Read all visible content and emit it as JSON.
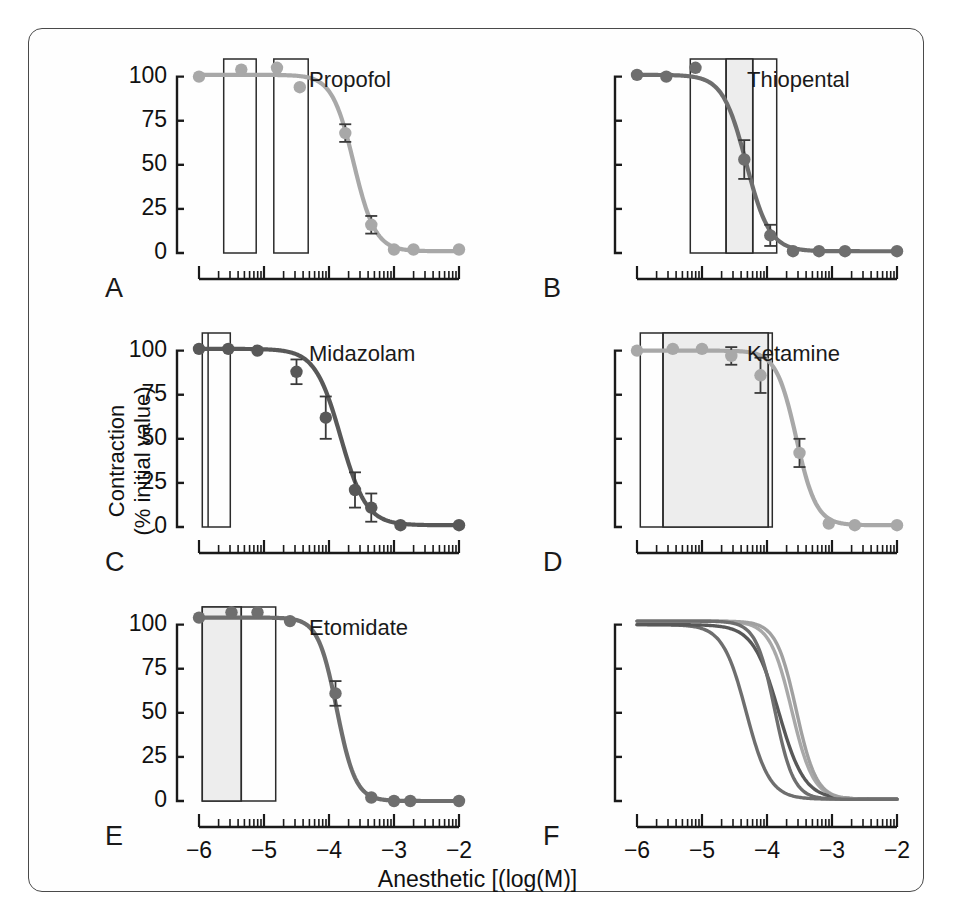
{
  "figure": {
    "x_axis_title": "Anesthetic [(log(M)]",
    "y_axis_title_line1": "Contraction",
    "y_axis_title_line2": "(% initial value)"
  },
  "axes": {
    "y_tick_labels": [
      "100",
      "75",
      "50",
      "25",
      "0"
    ],
    "y_tick_values": [
      100,
      75,
      50,
      25,
      0
    ],
    "x_tick_labels": [
      "−6",
      "−5",
      "−4",
      "−3",
      "−2"
    ],
    "x_tick_values": [
      -6,
      -5,
      -4,
      -3,
      -2
    ],
    "xlim": [
      -6,
      -2
    ],
    "ylim": [
      0,
      110
    ]
  },
  "colors": {
    "light_gray_curve": "#a8a8a8",
    "dark_gray_curve": "#5a5a5a",
    "mid_gray_curve": "#7a7a7a",
    "axis": "#1a1a1a",
    "box_stroke": "#2b2b2b",
    "box_shade": "#ededed",
    "frame": "#4a4a4a"
  },
  "panels": [
    {
      "letter": "A",
      "title": "Propofol",
      "color": "#a8a8a8",
      "y_labeled": true,
      "ec50": -3.62,
      "hill": 2.6,
      "top": 101,
      "points": [
        {
          "x": -6.0,
          "y": 100,
          "err": 0
        },
        {
          "x": -5.35,
          "y": 104,
          "err": 0
        },
        {
          "x": -4.8,
          "y": 105,
          "err": 0
        },
        {
          "x": -4.45,
          "y": 94,
          "err": 0
        },
        {
          "x": -3.75,
          "y": 68,
          "err": 5
        },
        {
          "x": -3.35,
          "y": 16,
          "err": 5
        },
        {
          "x": -3.0,
          "y": 2,
          "err": 0
        },
        {
          "x": -2.7,
          "y": 2,
          "err": 0
        },
        {
          "x": -2.0,
          "y": 2,
          "err": 0
        }
      ],
      "boxes": [
        {
          "x0": -5.62,
          "x1": -5.12,
          "shaded": false
        },
        {
          "x0": -4.85,
          "x1": -4.32,
          "shaded": false
        }
      ],
      "dividers": []
    },
    {
      "letter": "B",
      "title": "Thiopental",
      "color": "#6e6e6e",
      "y_labeled": false,
      "ec50": -4.32,
      "hill": 2.4,
      "top": 101,
      "points": [
        {
          "x": -6.0,
          "y": 101,
          "err": 0
        },
        {
          "x": -5.55,
          "y": 100,
          "err": 0
        },
        {
          "x": -5.1,
          "y": 105,
          "err": 0
        },
        {
          "x": -4.35,
          "y": 53,
          "err": 11
        },
        {
          "x": -3.95,
          "y": 10,
          "err": 6
        },
        {
          "x": -3.6,
          "y": 1,
          "err": 0
        },
        {
          "x": -3.2,
          "y": 1,
          "err": 0
        },
        {
          "x": -2.8,
          "y": 1,
          "err": 0
        },
        {
          "x": -2.0,
          "y": 1,
          "err": 0
        }
      ],
      "boxes": [
        {
          "x0": -5.18,
          "x1": -3.85,
          "shaded": false
        },
        {
          "x0": -4.63,
          "x1": -4.22,
          "shaded": true
        }
      ],
      "dividers": [
        -4.63,
        -4.22
      ]
    },
    {
      "letter": "C",
      "title": "Midazolam",
      "color": "#585858",
      "y_labeled": true,
      "ec50": -3.82,
      "hill": 2.2,
      "top": 101,
      "points": [
        {
          "x": -6.0,
          "y": 101,
          "err": 0
        },
        {
          "x": -5.55,
          "y": 101,
          "err": 0
        },
        {
          "x": -5.1,
          "y": 100,
          "err": 0
        },
        {
          "x": -4.5,
          "y": 88,
          "err": 7
        },
        {
          "x": -4.05,
          "y": 62,
          "err": 12
        },
        {
          "x": -3.6,
          "y": 21,
          "err": 10
        },
        {
          "x": -3.35,
          "y": 11,
          "err": 8
        },
        {
          "x": -2.9,
          "y": 1,
          "err": 0
        },
        {
          "x": -2.0,
          "y": 1,
          "err": 0
        }
      ],
      "boxes": [
        {
          "x0": -5.95,
          "x1": -5.52,
          "shaded": false
        }
      ],
      "dividers": [
        -5.86
      ]
    },
    {
      "letter": "D",
      "title": "Ketamine",
      "color": "#a8a8a8",
      "y_labeled": false,
      "ec50": -3.55,
      "hill": 2.8,
      "top": 100,
      "points": [
        {
          "x": -6.0,
          "y": 100,
          "err": 0
        },
        {
          "x": -5.45,
          "y": 101,
          "err": 0
        },
        {
          "x": -5.0,
          "y": 101,
          "err": 0
        },
        {
          "x": -4.55,
          "y": 97,
          "err": 5
        },
        {
          "x": -4.1,
          "y": 86,
          "err": 10
        },
        {
          "x": -3.5,
          "y": 42,
          "err": 8
        },
        {
          "x": -3.05,
          "y": 2,
          "err": 0
        },
        {
          "x": -2.65,
          "y": 1,
          "err": 0
        },
        {
          "x": -2.0,
          "y": 1,
          "err": 0
        }
      ],
      "boxes": [
        {
          "x0": -5.95,
          "x1": -3.92,
          "shaded": false
        },
        {
          "x0": -5.6,
          "x1": -3.98,
          "shaded": true
        }
      ],
      "dividers": [
        -5.6,
        -3.98
      ]
    },
    {
      "letter": "E",
      "title": "Etomidate",
      "color": "#6e6e6e",
      "y_labeled": true,
      "ec50": -3.88,
      "hill": 3.0,
      "top": 104,
      "points": [
        {
          "x": -6.0,
          "y": 104,
          "err": 0
        },
        {
          "x": -5.5,
          "y": 107,
          "err": 0
        },
        {
          "x": -5.1,
          "y": 107,
          "err": 0
        },
        {
          "x": -4.6,
          "y": 102,
          "err": 0
        },
        {
          "x": -3.9,
          "y": 61,
          "err": 7
        },
        {
          "x": -3.35,
          "y": 2,
          "err": 0
        },
        {
          "x": -3.0,
          "y": 0,
          "err": 0
        },
        {
          "x": -2.75,
          "y": 0,
          "err": 0
        },
        {
          "x": -2.0,
          "y": 0,
          "err": 0
        }
      ],
      "boxes": [
        {
          "x0": -5.95,
          "x1": -4.82,
          "shaded": false
        },
        {
          "x0": -5.95,
          "x1": -5.35,
          "shaded": true
        }
      ],
      "dividers": [
        -5.35
      ]
    },
    {
      "letter": "F",
      "title": "",
      "color": "#6e6e6e",
      "y_labeled": false,
      "overlay": true,
      "boxes": [],
      "dividers": [],
      "points": []
    }
  ],
  "chart_data": {
    "type": "line",
    "title": "",
    "xlabel": "Anesthetic [(log(M)]",
    "ylabel": "Contraction (% initial value)",
    "xlim": [
      -6,
      -2
    ],
    "ylim": [
      0,
      110
    ],
    "xticks": [
      -6,
      -5,
      -4,
      -3,
      -2
    ],
    "yticks": [
      0,
      25,
      50,
      75,
      100
    ],
    "grid": false,
    "legend": "none",
    "x_scale": "log10 concentration (M)",
    "panels": [
      {
        "panel": "A",
        "name": "Propofol",
        "x": [
          -6.0,
          -5.35,
          -4.8,
          -4.45,
          -3.75,
          -3.35,
          -3.0,
          -2.7,
          -2.0
        ],
        "y": [
          100,
          104,
          105,
          94,
          68,
          16,
          2,
          2,
          2
        ],
        "yerr": [
          0,
          0,
          0,
          0,
          5,
          5,
          0,
          0,
          0
        ],
        "fit": {
          "type": "sigmoid",
          "ec50_log": -3.62,
          "hill": 2.6,
          "top": 101,
          "bottom": 1
        }
      },
      {
        "panel": "B",
        "name": "Thiopental",
        "x": [
          -6.0,
          -5.55,
          -5.1,
          -4.35,
          -3.95,
          -3.6,
          -3.2,
          -2.8,
          -2.0
        ],
        "y": [
          101,
          100,
          105,
          53,
          10,
          1,
          1,
          1,
          1
        ],
        "yerr": [
          0,
          0,
          0,
          11,
          6,
          0,
          0,
          0,
          0
        ],
        "fit": {
          "type": "sigmoid",
          "ec50_log": -4.32,
          "hill": 2.4,
          "top": 101,
          "bottom": 1
        }
      },
      {
        "panel": "C",
        "name": "Midazolam",
        "x": [
          -6.0,
          -5.55,
          -5.1,
          -4.5,
          -4.05,
          -3.6,
          -3.35,
          -2.9,
          -2.0
        ],
        "y": [
          101,
          101,
          100,
          88,
          62,
          21,
          11,
          1,
          1
        ],
        "yerr": [
          0,
          0,
          0,
          7,
          12,
          10,
          8,
          0,
          0
        ],
        "fit": {
          "type": "sigmoid",
          "ec50_log": -3.82,
          "hill": 2.2,
          "top": 101,
          "bottom": 1
        }
      },
      {
        "panel": "D",
        "name": "Ketamine",
        "x": [
          -6.0,
          -5.45,
          -5.0,
          -4.55,
          -4.1,
          -3.5,
          -3.05,
          -2.65,
          -2.0
        ],
        "y": [
          100,
          101,
          101,
          97,
          86,
          42,
          2,
          1,
          1
        ],
        "yerr": [
          0,
          0,
          0,
          5,
          10,
          8,
          0,
          0,
          0
        ],
        "fit": {
          "type": "sigmoid",
          "ec50_log": -3.55,
          "hill": 2.8,
          "top": 100,
          "bottom": 1
        }
      },
      {
        "panel": "E",
        "name": "Etomidate",
        "x": [
          -6.0,
          -5.5,
          -5.1,
          -4.6,
          -3.9,
          -3.35,
          -3.0,
          -2.75,
          -2.0
        ],
        "y": [
          104,
          107,
          107,
          102,
          61,
          2,
          0,
          0,
          0
        ],
        "yerr": [
          0,
          0,
          0,
          0,
          7,
          0,
          0,
          0,
          0
        ],
        "fit": {
          "type": "sigmoid",
          "ec50_log": -3.88,
          "hill": 3.0,
          "top": 104,
          "bottom": 0
        }
      },
      {
        "panel": "F",
        "name": "All anesthetics overlay",
        "series": [
          {
            "name": "Propofol",
            "ec50_log": -3.62,
            "hill": 2.6,
            "top": 102,
            "bottom": 1,
            "color": "#a8a8a8"
          },
          {
            "name": "Thiopental",
            "ec50_log": -4.32,
            "hill": 2.4,
            "top": 100,
            "bottom": 1,
            "color": "#6e6e6e"
          },
          {
            "name": "Midazolam",
            "ec50_log": -3.82,
            "hill": 2.2,
            "top": 100,
            "bottom": 1,
            "color": "#585858"
          },
          {
            "name": "Ketamine",
            "ec50_log": -3.55,
            "hill": 2.8,
            "top": 102,
            "bottom": 1,
            "color": "#a0a0a0"
          },
          {
            "name": "Etomidate",
            "ec50_log": -3.88,
            "hill": 3.0,
            "top": 102,
            "bottom": 1,
            "color": "#6e6e6e"
          }
        ]
      }
    ]
  }
}
